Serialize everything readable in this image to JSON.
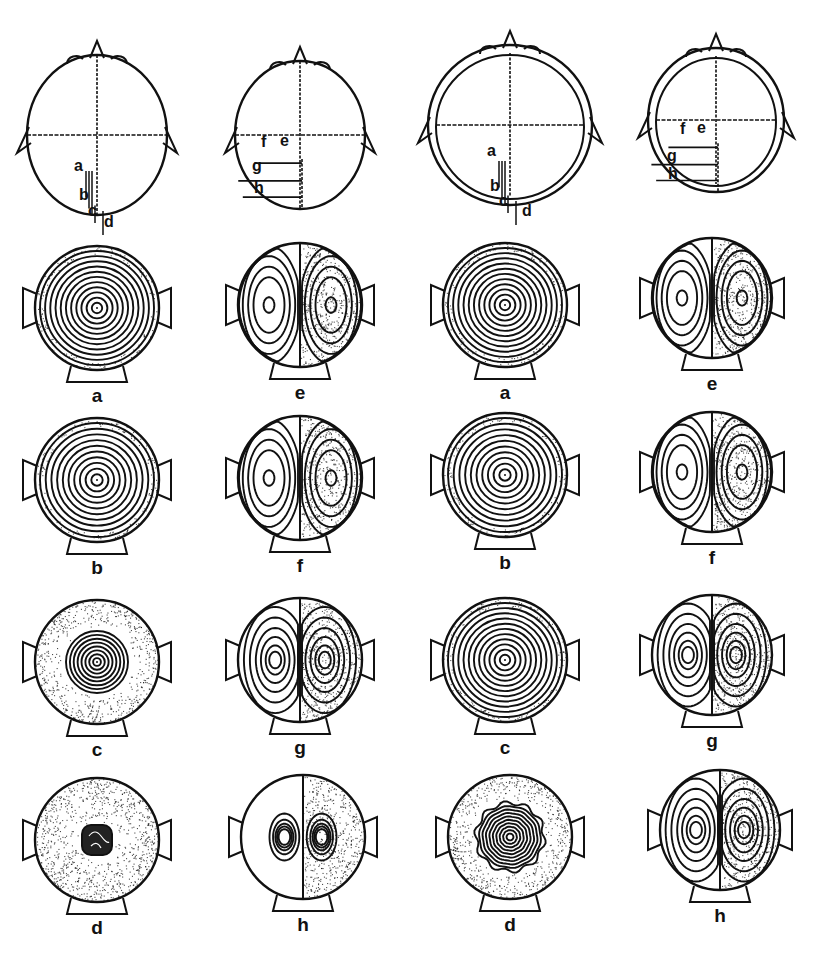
{
  "figure": {
    "ink_color": "#111111",
    "background": "#ffffff",
    "columns": [
      97,
      300,
      506,
      712
    ],
    "schematics": [
      {
        "id": "head-1",
        "cx": 97,
        "cy": 135,
        "rx": 70,
        "ry": 80,
        "double_shell": false,
        "probe": "vertical",
        "labels": [
          {
            "text": "a",
            "x": 74,
            "y": 170
          },
          {
            "text": "b",
            "x": 79,
            "y": 199
          },
          {
            "text": "c",
            "x": 88,
            "y": 215
          },
          {
            "text": "d",
            "x": 104,
            "y": 226
          }
        ]
      },
      {
        "id": "head-2",
        "cx": 300,
        "cy": 135,
        "rx": 65,
        "ry": 74,
        "double_shell": false,
        "probe": "horizontal",
        "labels": [
          {
            "text": "f",
            "x": 261,
            "y": 146
          },
          {
            "text": "e",
            "x": 280,
            "y": 145
          },
          {
            "text": "g",
            "x": 252,
            "y": 170
          },
          {
            "text": "h",
            "x": 254,
            "y": 192
          }
        ]
      },
      {
        "id": "head-3",
        "cx": 510,
        "cy": 125,
        "rx": 82,
        "ry": 80,
        "double_shell": true,
        "probe": "vertical",
        "labels": [
          {
            "text": "a",
            "x": 487,
            "y": 155
          },
          {
            "text": "b",
            "x": 490,
            "y": 190
          },
          {
            "text": "c",
            "x": 499,
            "y": 205
          },
          {
            "text": "d",
            "x": 522,
            "y": 215
          }
        ]
      },
      {
        "id": "head-4",
        "cx": 716,
        "cy": 120,
        "rx": 68,
        "ry": 72,
        "double_shell": true,
        "probe": "horizontal",
        "labels": [
          {
            "text": "f",
            "x": 680,
            "y": 133
          },
          {
            "text": "e",
            "x": 697,
            "y": 132
          },
          {
            "text": "g",
            "x": 667,
            "y": 160
          },
          {
            "text": "h",
            "x": 668,
            "y": 178
          }
        ]
      }
    ],
    "maps": [
      {
        "label": "a",
        "cx": 97,
        "cy": 308,
        "r": 62,
        "pattern": "concentric",
        "rings": 11,
        "stipple": "edge-light"
      },
      {
        "label": "e",
        "cx": 300,
        "cy": 305,
        "r": 62,
        "pattern": "dipole-lateral",
        "stipple": "right-half"
      },
      {
        "label": "a",
        "cx": 505,
        "cy": 305,
        "r": 62,
        "pattern": "concentric",
        "rings": 11,
        "stipple": "edge-light"
      },
      {
        "label": "e",
        "cx": 712,
        "cy": 298,
        "r": 60,
        "pattern": "dipole-lateral",
        "stipple": "right-half"
      },
      {
        "label": "b",
        "cx": 97,
        "cy": 480,
        "r": 62,
        "pattern": "concentric",
        "rings": 10,
        "stipple": "edge-light"
      },
      {
        "label": "f",
        "cx": 300,
        "cy": 478,
        "r": 62,
        "pattern": "dipole-lateral",
        "stipple": "right-half"
      },
      {
        "label": "b",
        "cx": 505,
        "cy": 475,
        "r": 62,
        "pattern": "concentric",
        "rings": 10,
        "stipple": "edge-light"
      },
      {
        "label": "f",
        "cx": 712,
        "cy": 472,
        "r": 60,
        "pattern": "dipole-lateral",
        "stipple": "right-half"
      },
      {
        "label": "c",
        "cx": 97,
        "cy": 662,
        "r": 62,
        "pattern": "concentric-small",
        "rings": 8,
        "stipple": "outer-ring"
      },
      {
        "label": "g",
        "cx": 300,
        "cy": 660,
        "r": 62,
        "pattern": "dipole-close",
        "stipple": "right-half"
      },
      {
        "label": "c",
        "cx": 505,
        "cy": 660,
        "r": 62,
        "pattern": "concentric",
        "rings": 11,
        "stipple": "edge-light"
      },
      {
        "label": "g",
        "cx": 712,
        "cy": 655,
        "r": 60,
        "pattern": "dipole-close",
        "stipple": "right-half"
      },
      {
        "label": "d",
        "cx": 97,
        "cy": 840,
        "r": 62,
        "pattern": "dense-core",
        "stipple": "full"
      },
      {
        "label": "h",
        "cx": 303,
        "cy": 837,
        "r": 62,
        "pattern": "dipole-tight",
        "stipple": "right-half"
      },
      {
        "label": "d",
        "cx": 510,
        "cy": 837,
        "r": 62,
        "pattern": "scalloped-core",
        "rings": 10,
        "stipple": "outer-ring"
      },
      {
        "label": "h",
        "cx": 720,
        "cy": 830,
        "r": 60,
        "pattern": "dipole-close",
        "stipple": "right-half"
      }
    ]
  }
}
